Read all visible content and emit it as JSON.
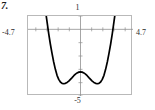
{
  "problem": {
    "number_label": "7."
  },
  "graph": {
    "window_labels": {
      "top": "1",
      "bottom": "-5",
      "left": "-4.7",
      "right": "4.7"
    },
    "colors": {
      "curve": "#000000",
      "frame": "#b9b9b9",
      "axis": "#8f8f8f"
    }
  },
  "chart_data": {
    "type": "line",
    "title": "",
    "xlabel": "",
    "ylabel": "",
    "xlim": [
      -4.7,
      4.7
    ],
    "ylim": [
      -5,
      1
    ],
    "grid": false,
    "legend": null,
    "axis_tick_spacing": 1,
    "tick_labels": {
      "x": [
        "-4.7",
        "4.7"
      ],
      "y": [
        "-5",
        "1"
      ]
    },
    "annotations": [
      {
        "label": "local maximum",
        "x": 0,
        "y": -3.2
      },
      {
        "label": "local minimum (left)",
        "x": -1.4,
        "y": -4.05
      },
      {
        "label": "local minimum (right)",
        "x": 1.4,
        "y": -4.05
      }
    ],
    "series": [
      {
        "name": "f(x)",
        "x": [
          -3.1,
          -3.0,
          -2.85,
          -2.7,
          -2.55,
          -2.4,
          -2.25,
          -2.1,
          -1.95,
          -1.8,
          -1.65,
          -1.5,
          -1.35,
          -1.2,
          -1.05,
          -0.9,
          -0.75,
          -0.6,
          -0.45,
          -0.3,
          -0.15,
          0.0,
          0.15,
          0.3,
          0.45,
          0.6,
          0.75,
          0.9,
          1.05,
          1.2,
          1.35,
          1.5,
          1.65,
          1.8,
          1.95,
          2.1,
          2.25,
          2.4,
          2.55,
          2.7,
          2.85,
          3.0,
          3.1
        ],
        "y": [
          1.2,
          0.6,
          -0.3,
          -1.1,
          -1.8,
          -2.45,
          -3.0,
          -3.45,
          -3.75,
          -3.95,
          -4.05,
          -4.08,
          -4.05,
          -3.98,
          -3.88,
          -3.75,
          -3.62,
          -3.48,
          -3.36,
          -3.27,
          -3.21,
          -3.19,
          -3.21,
          -3.27,
          -3.36,
          -3.48,
          -3.62,
          -3.75,
          -3.88,
          -3.98,
          -4.05,
          -4.08,
          -4.05,
          -3.95,
          -3.75,
          -3.45,
          -3.0,
          -2.45,
          -1.8,
          -1.1,
          -0.3,
          0.6,
          1.2
        ]
      }
    ]
  }
}
